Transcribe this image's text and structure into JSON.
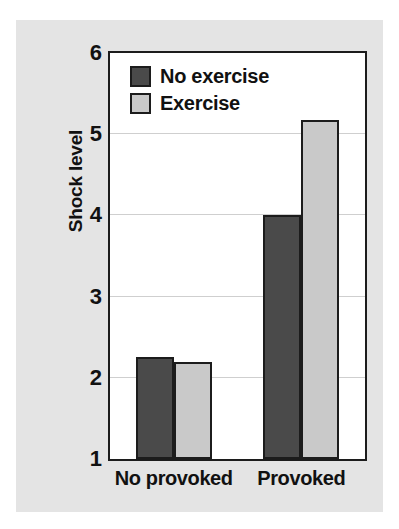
{
  "chart_data": {
    "type": "bar",
    "title": "",
    "subtitle": "",
    "xlabel": "",
    "ylabel": "Shock level",
    "categories": [
      "No provoked",
      "Provoked"
    ],
    "series": [
      {
        "name": "No exercise",
        "color": "#4a4a4a",
        "values": [
          2.26,
          4.0
        ]
      },
      {
        "name": "Exercise",
        "color": "#c9c9c9",
        "values": [
          2.19,
          5.18
        ]
      }
    ],
    "ylim": [
      1,
      6
    ],
    "y_ticks": [
      1,
      2,
      3,
      4,
      5,
      6
    ],
    "y_tick_labels": [
      "1",
      "2",
      "3",
      "4",
      "5",
      "6"
    ],
    "gridlines": [
      2,
      3,
      4,
      5
    ],
    "grid": true,
    "legend_position": "top-left",
    "colors": {
      "figure_background": "#e4e4e4",
      "plot_background": "#ffffff",
      "axis_line": "#1c1c1c",
      "gridline": "#cfcfcf",
      "text": "#111111"
    }
  }
}
